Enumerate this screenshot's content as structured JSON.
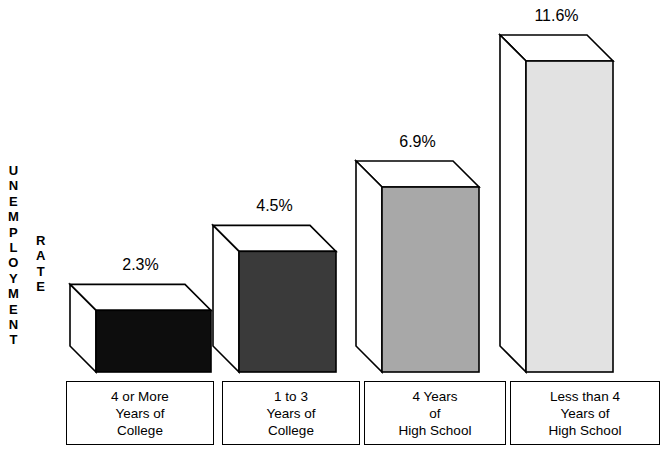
{
  "axis": {
    "primary_label": "UNEMPLOYMENT",
    "secondary_label": "RATE"
  },
  "chart_data": {
    "type": "bar",
    "title": "",
    "subtitle": "",
    "xlabel": "",
    "ylabel": "UNEMPLOYMENT RATE",
    "ylim": [
      0,
      11.6
    ],
    "grid": false,
    "legend": "none",
    "style": "3d-isometric-bars",
    "categories": [
      "4 or More Years of College",
      "1 to 3 Years of College",
      "4 Years of High School",
      "Less than 4 Years of High School"
    ],
    "category_lines": [
      [
        "4 or More",
        "Years of",
        "College"
      ],
      [
        "1 to 3",
        "Years of",
        "College"
      ],
      [
        "4 Years",
        "of",
        "High School"
      ],
      [
        "Less than 4",
        "Years of",
        "High School"
      ]
    ],
    "values": [
      2.3,
      4.5,
      6.9,
      11.6
    ],
    "value_labels": [
      "2.3%",
      "4.5%",
      "6.9%",
      "11.6%"
    ],
    "bar_face_colors": [
      "#0d0d0d",
      "#3a3a3a",
      "#a8a8a8",
      "#e2e2e2"
    ],
    "bar_top_color": "#ffffff",
    "bar_side_color": "#ffffff",
    "bar_outline_color": "#000000"
  }
}
